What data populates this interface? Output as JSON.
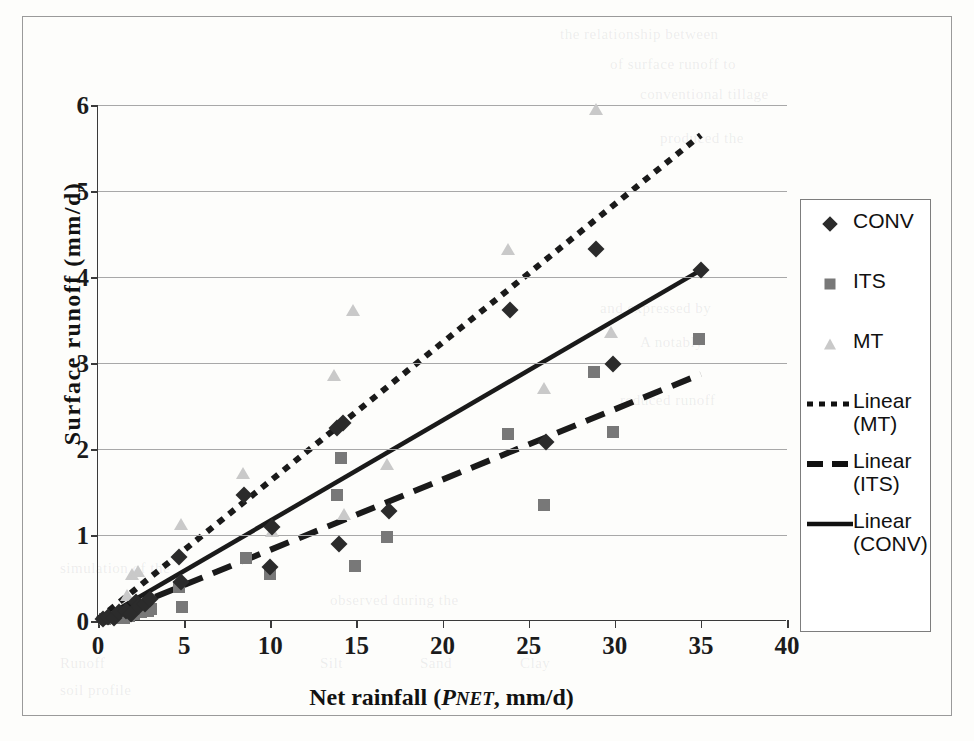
{
  "chart_data": {
    "type": "scatter",
    "title": "",
    "xlabel": "Net rainfall (PNET, mm/d)",
    "ylabel": "Surface runoff (mm/d)",
    "xlim": [
      0,
      40
    ],
    "ylim": [
      0,
      6
    ],
    "xticks": [
      0,
      5,
      10,
      15,
      20,
      25,
      30,
      35,
      40
    ],
    "yticks": [
      0,
      1,
      2,
      3,
      4,
      5,
      6
    ],
    "grid": "horizontal",
    "legend_position": "right",
    "series": [
      {
        "name": "CONV",
        "marker": "diamond",
        "color": "#2b2b2b",
        "points": [
          [
            0.3,
            0.02
          ],
          [
            0.6,
            0.05
          ],
          [
            0.9,
            0.04
          ],
          [
            1.2,
            0.1
          ],
          [
            1.6,
            0.12
          ],
          [
            1.9,
            0.08
          ],
          [
            2.2,
            0.22
          ],
          [
            2.4,
            0.17
          ],
          [
            2.7,
            0.2
          ],
          [
            3.0,
            0.26
          ],
          [
            4.7,
            0.75
          ],
          [
            4.8,
            0.45
          ],
          [
            8.5,
            1.46
          ],
          [
            10.0,
            0.63
          ],
          [
            10.1,
            1.09
          ],
          [
            13.9,
            2.25
          ],
          [
            14.0,
            0.9
          ],
          [
            14.2,
            2.3
          ],
          [
            16.9,
            1.28
          ],
          [
            23.9,
            3.62
          ],
          [
            26.0,
            2.08
          ],
          [
            28.9,
            4.33
          ],
          [
            29.9,
            2.99
          ],
          [
            35.0,
            4.08
          ]
        ]
      },
      {
        "name": "ITS",
        "marker": "square",
        "color": "#787878",
        "points": [
          [
            0.4,
            0.02
          ],
          [
            0.8,
            0.03
          ],
          [
            1.1,
            0.05
          ],
          [
            1.5,
            0.04
          ],
          [
            1.8,
            0.06
          ],
          [
            2.1,
            0.08
          ],
          [
            2.5,
            0.1
          ],
          [
            2.9,
            0.12
          ],
          [
            3.1,
            0.14
          ],
          [
            4.7,
            0.4
          ],
          [
            4.9,
            0.16
          ],
          [
            8.6,
            0.73
          ],
          [
            10.0,
            0.55
          ],
          [
            13.9,
            1.46
          ],
          [
            14.1,
            1.9
          ],
          [
            14.9,
            0.64
          ],
          [
            16.8,
            0.98
          ],
          [
            23.8,
            2.18
          ],
          [
            25.9,
            1.35
          ],
          [
            28.8,
            2.89
          ],
          [
            29.9,
            2.2
          ],
          [
            34.9,
            3.28
          ]
        ]
      },
      {
        "name": "MT",
        "marker": "triangle",
        "color": "#c9c9c9",
        "points": [
          [
            0.5,
            0.03
          ],
          [
            0.9,
            0.06
          ],
          [
            1.3,
            0.09
          ],
          [
            1.7,
            0.3
          ],
          [
            2.0,
            0.55
          ],
          [
            2.3,
            0.58
          ],
          [
            2.6,
            0.2
          ],
          [
            4.8,
            1.13
          ],
          [
            8.4,
            1.72
          ],
          [
            10.1,
            1.05
          ],
          [
            13.7,
            2.86
          ],
          [
            14.3,
            1.24
          ],
          [
            14.8,
            3.62
          ],
          [
            16.8,
            1.82
          ],
          [
            23.8,
            4.32
          ],
          [
            25.9,
            2.71
          ],
          [
            28.9,
            5.95
          ],
          [
            29.8,
            3.36
          ]
        ]
      }
    ],
    "trendlines": [
      {
        "name": "Linear (MT)",
        "style": "dotted",
        "color": "#1a1a1a",
        "x0": 0,
        "y0": 0.02,
        "x1": 35,
        "y1": 5.65
      },
      {
        "name": "Linear (ITS)",
        "style": "dashed",
        "color": "#1a1a1a",
        "x0": 0,
        "y0": 0.01,
        "x1": 35,
        "y1": 2.87
      },
      {
        "name": "Linear (CONV)",
        "style": "solid",
        "color": "#1a1a1a",
        "x0": 0,
        "y0": 0.0,
        "x1": 35,
        "y1": 4.08
      }
    ]
  },
  "axes": {
    "y_tick_labels": [
      "6",
      "5",
      "4",
      "3",
      "2",
      "1",
      "0"
    ],
    "x_tick_labels": [
      "0",
      "5",
      "10",
      "15",
      "20",
      "25",
      "30",
      "35",
      "40"
    ],
    "y_title": "Surface runoff (mm/d)",
    "x_title_main": "Net rainfall (",
    "x_title_var": "P",
    "x_title_sub": "NET",
    "x_title_tail": ", mm/d)"
  },
  "legend": {
    "items": [
      {
        "label": "CONV",
        "key": "diamond-marker"
      },
      {
        "label": "ITS",
        "key": "square-marker"
      },
      {
        "label": "MT",
        "key": "triangle-marker"
      },
      {
        "label": "Linear (MT)",
        "key": "dotted-line"
      },
      {
        "label": "Linear (ITS)",
        "key": "dashed-line"
      },
      {
        "label": "Linear (CONV)",
        "key": "solid-line"
      }
    ]
  },
  "bleed_text": [
    "the relationship between",
    "of surface runoff to",
    "conventional tillage",
    "produced the",
    "and expressed by",
    "A notably",
    "reduced runoff",
    "simulation of the",
    "observed during the",
    "Runoff",
    "Silt",
    "Clay",
    "Sand",
    "soil profile"
  ]
}
